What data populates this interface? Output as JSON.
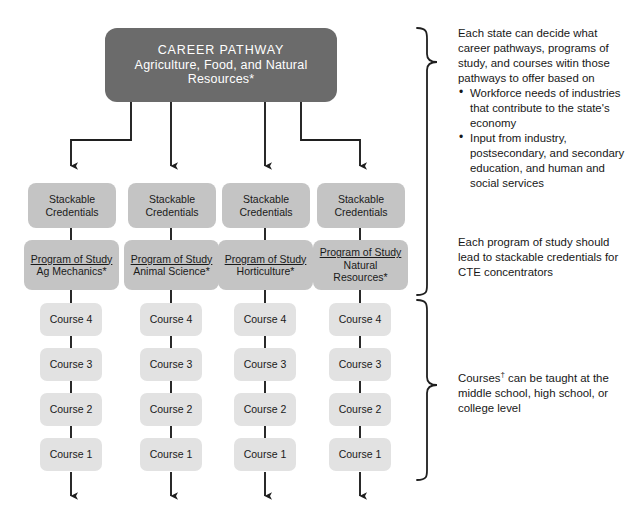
{
  "header": {
    "line1": "CAREER PATHWAY",
    "line2": "Agriculture, Food, and Natural",
    "line3": "Resources*"
  },
  "columns": [
    {
      "credentials": {
        "line1": "Stackable",
        "line2": "Credentials"
      },
      "program": {
        "title": "Program of Study",
        "name": "Ag Mechanics*",
        "name2": ""
      },
      "courses": [
        "Course 4",
        "Course 3",
        "Course 2",
        "Course 1"
      ]
    },
    {
      "credentials": {
        "line1": "Stackable",
        "line2": "Credentials"
      },
      "program": {
        "title": "Program of Study",
        "name": "Animal Science*",
        "name2": ""
      },
      "courses": [
        "Course 4",
        "Course 3",
        "Course 2",
        "Course 1"
      ]
    },
    {
      "credentials": {
        "line1": "Stackable",
        "line2": "Credentials"
      },
      "program": {
        "title": "Program of Study",
        "name": "Horticulture*",
        "name2": ""
      },
      "courses": [
        "Course 4",
        "Course 3",
        "Course 2",
        "Course 1"
      ]
    },
    {
      "credentials": {
        "line1": "Stackable",
        "line2": "Credentials"
      },
      "program": {
        "title": "Program of Study",
        "name": "Natural",
        "name2": "Resources*"
      },
      "courses": [
        "Course 4",
        "Course 3",
        "Course 2",
        "Course 1"
      ]
    }
  ],
  "notes": {
    "state_note": {
      "paragraph": "Each state can decide what career pathways, programs of study, and courses witin those pathways to offer based on",
      "bullets": [
        "Workforce needs of industries that contribute to the state's economy",
        "Input from industry, postsecondary, and secondary education, and human and social services"
      ]
    },
    "program_note": "Each program of study should lead to stackable credentials for CTE concentrators",
    "courses_note_prefix": "Courses",
    "courses_note_marker": "†",
    "courses_note_rest": " can be taught at the middle school, high school, or college level"
  },
  "colors": {
    "header_box": "#6b6b6b",
    "credential_box": "#c4c4c4",
    "course_box": "#e2e2e2",
    "line": "#1f1f1f",
    "background": "#ffffff"
  }
}
